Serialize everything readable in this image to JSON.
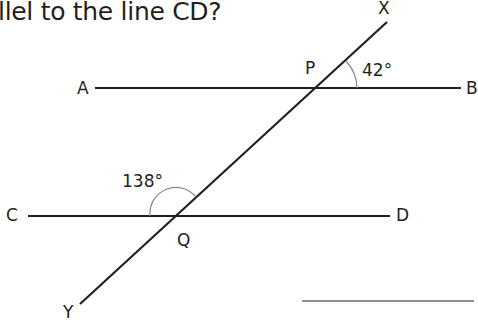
{
  "question": {
    "text": "llel to the line CD?"
  },
  "diagram": {
    "points": {
      "A": "A",
      "B": "B",
      "C": "C",
      "D": "D",
      "P": "P",
      "Q": "Q",
      "X": "X",
      "Y": "Y"
    },
    "angles": {
      "at_P": "42°",
      "at_Q": "138°"
    }
  },
  "answer": {
    "value": ""
  }
}
